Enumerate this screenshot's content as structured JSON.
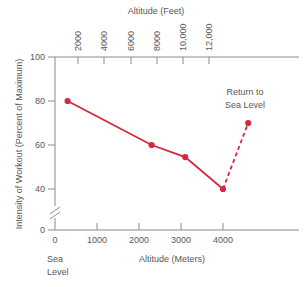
{
  "chart_data": {
    "type": "line",
    "title": "",
    "xlabel": "Altitude (Meters)",
    "ylabel": "Intensity of Workout (Percent of Maximum)",
    "secondary_xlabel": "Altitude (Feet)",
    "xlim": [
      0,
      4800
    ],
    "ylim": [
      0,
      100
    ],
    "ylim_visual_break": true,
    "y_break_between": [
      0,
      35
    ],
    "grid": false,
    "legend": "none",
    "x_ticks": [
      0,
      1000,
      2000,
      3000,
      4000
    ],
    "x_tick_labels": [
      "0",
      "1000",
      "2000",
      "3000",
      "4000"
    ],
    "y_ticks": [
      0,
      40,
      60,
      80,
      100
    ],
    "y_tick_labels": [
      "0",
      "40",
      "60",
      "80",
      "100"
    ],
    "secondary_x_ticks_feet": [
      2000,
      4000,
      6000,
      8000,
      10000,
      12000
    ],
    "secondary_x_tick_labels": [
      "2000",
      "4000",
      "6000",
      "8000",
      "10,000",
      "12,000"
    ],
    "series": [
      {
        "name": "Ascent",
        "style": "solid",
        "color": "#D6283C",
        "x": [
          300,
          2300,
          3100,
          4000
        ],
        "y": [
          80,
          60,
          54.5,
          40
        ]
      },
      {
        "name": "Return to Sea Level",
        "style": "dashed",
        "color": "#D6283C",
        "x": [
          4000,
          4600
        ],
        "y": [
          40,
          70
        ]
      }
    ],
    "annotations": [
      {
        "text_line1": "Return to",
        "text_line2": "Sea Level",
        "x": 4400,
        "y": 83
      },
      {
        "text_line1": "Sea",
        "text_line2": "Level",
        "x": 0,
        "y": -12
      }
    ]
  },
  "labels": {
    "top_axis_title": "Altitude (Feet)",
    "bottom_axis_title": "Altitude (Meters)",
    "y_axis_title": "Intensity of Workout (Percent of Maximum)",
    "sea_line1": "Sea",
    "sea_line2": "Level",
    "return_line1": "Return to",
    "return_line2": "Sea Level",
    "y_100": "100",
    "y_80": "80",
    "y_60": "60",
    "y_40": "40",
    "y_0": "0",
    "x_0": "0",
    "x_1000": "1000",
    "x_2000": "2000",
    "x_3000": "3000",
    "x_4000": "4000",
    "ft_2000": "2000",
    "ft_4000": "4000",
    "ft_6000": "6000",
    "ft_8000": "8000",
    "ft_10000": "10,000",
    "ft_12000": "12,000"
  },
  "colors": {
    "series": "#D6283C",
    "axis": "#8a8a8d",
    "text": "#58585a",
    "background": "#ffffff"
  }
}
